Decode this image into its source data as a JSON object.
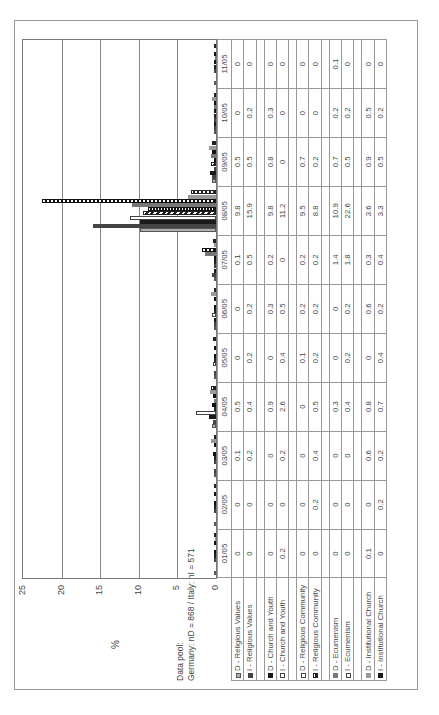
{
  "chart_data": {
    "type": "bar",
    "orientation": "page rotated 90deg counter-clockwise",
    "title": "",
    "xlabel": "",
    "ylabel": "%",
    "ylim": [
      0,
      25
    ],
    "yticks": [
      "0",
      "5",
      "10",
      "15",
      "20",
      "25"
    ],
    "grid": true,
    "legend_position": "data table below plot",
    "categories": [
      "01/05",
      "02/05",
      "03/05",
      "04/05",
      "05/05",
      "06/05",
      "07/05",
      "08/05",
      "09/05",
      "10/05",
      "11/05"
    ],
    "series": [
      {
        "name": "D - Religious Values",
        "values": [
          0,
          0,
          0.1,
          0.5,
          0,
          0,
          0.1,
          9.8,
          0.5,
          0,
          0
        ]
      },
      {
        "name": "I - Religious Values",
        "values": [
          0,
          0,
          0.2,
          0.4,
          0.2,
          0.2,
          0.5,
          15.9,
          0.5,
          0.2,
          0
        ]
      },
      {
        "name": "D - Church and Youth",
        "values": [
          0,
          0,
          0,
          0.9,
          0,
          0.3,
          0.2,
          9.8,
          0.8,
          0.3,
          0
        ]
      },
      {
        "name": "I - Church and Youth",
        "values": [
          0.2,
          0,
          0.2,
          2.6,
          0.4,
          0.5,
          0,
          11.2,
          0,
          0,
          0
        ]
      },
      {
        "name": "D - Religious Community",
        "values": [
          0,
          0,
          0,
          0,
          0.1,
          0.2,
          0.2,
          9.5,
          0.7,
          0,
          0
        ]
      },
      {
        "name": "I - Religious Community",
        "values": [
          0,
          0.2,
          0.4,
          0.5,
          0.2,
          0.2,
          0.2,
          8.8,
          0.2,
          0,
          0
        ]
      },
      {
        "name": "D - Ecumenism",
        "values": [
          0,
          0,
          0,
          0.3,
          0,
          0,
          1.4,
          10.9,
          0.7,
          0.2,
          0.1
        ]
      },
      {
        "name": "I - Ecumenism",
        "values": [
          0,
          0,
          0,
          0.4,
          0.2,
          0.2,
          1.8,
          22.6,
          0.5,
          0.2,
          0
        ]
      },
      {
        "name": "D - Institutional Church",
        "values": [
          0.1,
          0,
          0.6,
          0.8,
          0,
          0.6,
          0.3,
          3.6,
          0.9,
          0.5,
          0
        ]
      },
      {
        "name": "I - Institutional Church",
        "values": [
          0,
          0.2,
          0.2,
          0.7,
          0.4,
          0.2,
          0.4,
          3.3,
          0.5,
          0.2,
          0
        ]
      }
    ]
  },
  "axis": {
    "ylabel": "%",
    "ticks": [
      "25",
      "20",
      "15",
      "10",
      "5",
      "0"
    ]
  },
  "datapool": {
    "line1": "Data pool:",
    "line2": "Germany: nD = 868 / Italy: nI = 571"
  },
  "table": {
    "months": [
      "01/05",
      "02/05",
      "03/05",
      "04/05",
      "05/05",
      "06/05",
      "07/05",
      "08/05",
      "09/05",
      "10/05",
      "11/05"
    ],
    "rows": [
      {
        "label": "D - Religious Values",
        "swatch": "p0",
        "values": [
          "0",
          "0",
          "0.1",
          "0.5",
          "0",
          "0",
          "0.1",
          "9.8",
          "0.5",
          "0",
          "0"
        ]
      },
      {
        "label": "I - Religious Values",
        "swatch": "p1",
        "values": [
          "0",
          "0",
          "0.2",
          "0.4",
          "0.2",
          "0.2",
          "0.5",
          "15.9",
          "0.5",
          "0.2",
          "0"
        ]
      },
      {
        "label": "D - Church and Youth",
        "swatch": "p5",
        "values": [
          "0",
          "0",
          "0",
          "0.9",
          "0",
          "0.3",
          "0.2",
          "9.8",
          "0.8",
          "0.3",
          "0"
        ]
      },
      {
        "label": "I - Church and Youth",
        "swatch": "p3",
        "values": [
          "0.2",
          "0",
          "0.2",
          "2.6",
          "0.4",
          "0.5",
          "0",
          "11.2",
          "0",
          "0",
          "0"
        ]
      },
      {
        "label": "D - Religious Community",
        "swatch": "p3",
        "values": [
          "0",
          "0",
          "0",
          "0",
          "0.1",
          "0.2",
          "0.2",
          "9.5",
          "0.7",
          "0",
          "0"
        ]
      },
      {
        "label": "I - Religious Community",
        "swatch": "p2",
        "values": [
          "0",
          "0.2",
          "0.4",
          "0.5",
          "0.2",
          "0.2",
          "0.2",
          "8.8",
          "0.2",
          "0",
          "0"
        ]
      },
      {
        "label": "D - Ecumenism",
        "swatch": "p7",
        "values": [
          "0",
          "0",
          "0",
          "0.3",
          "0",
          "0",
          "1.4",
          "10.9",
          "0.7",
          "0.2",
          "0.1"
        ]
      },
      {
        "label": "I - Ecumenism",
        "swatch": "p3",
        "values": [
          "0",
          "0",
          "0",
          "0.4",
          "0.2",
          "0.2",
          "1.8",
          "22.6",
          "0.5",
          "0.2",
          "0"
        ]
      },
      {
        "label": "D - Institutional Church",
        "swatch": "p9",
        "values": [
          "0.1",
          "0",
          "0.6",
          "0.8",
          "0",
          "0.6",
          "0.3",
          "3.6",
          "0.9",
          "0.5",
          "0"
        ]
      },
      {
        "label": "I - Institutional Church",
        "swatch": "p5",
        "values": [
          "0",
          "0.2",
          "0.2",
          "0.7",
          "0.4",
          "0.2",
          "0.4",
          "3.3",
          "0.5",
          "0.2",
          "0"
        ]
      }
    ]
  }
}
